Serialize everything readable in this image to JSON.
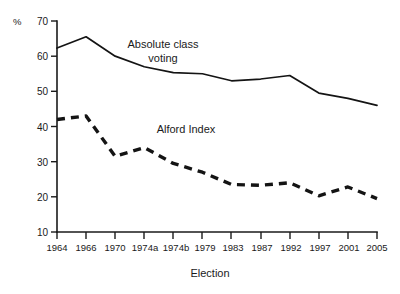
{
  "chart_data": {
    "type": "line",
    "title": "",
    "xlabel": "Election",
    "ylabel": "%",
    "ylim": [
      10,
      70
    ],
    "yticks": [
      10,
      20,
      30,
      40,
      50,
      60,
      70
    ],
    "grid": false,
    "legend_position": "inline-annotations",
    "categories": [
      "1964",
      "1966",
      "1970",
      "1974a",
      "1974b",
      "1979",
      "1983",
      "1987",
      "1992",
      "1997",
      "2001",
      "2005"
    ],
    "series": [
      {
        "name": "Absolute class voting",
        "style": "solid",
        "values": [
          62.3,
          65.5,
          60.0,
          57.0,
          55.3,
          55.0,
          53.0,
          53.5,
          54.5,
          49.5,
          48.0,
          46.0
        ]
      },
      {
        "name": "Alford Index",
        "style": "dashed",
        "values": [
          42.0,
          43.0,
          31.5,
          34.0,
          29.5,
          27.0,
          23.5,
          23.3,
          24.0,
          20.3,
          22.8,
          19.5
        ]
      }
    ],
    "annotations": [
      {
        "id": "absolute-class-voting-label",
        "text": "Absolute class voting",
        "line1": "Absolute class",
        "line2": "voting"
      },
      {
        "id": "alford-index-label",
        "text": "Alford Index",
        "line1": "Alford Index",
        "line2": ""
      }
    ],
    "colors": {
      "axis": "#1a1a1a",
      "series_absolute_class_voting": "#141414",
      "series_alford_index": "#141414",
      "background": "#ffffff"
    }
  },
  "axis": {
    "y_unit": "%",
    "y_tick_labels": [
      "70",
      "60",
      "50",
      "40",
      "30",
      "20",
      "10"
    ],
    "x_tick_labels": [
      "1964",
      "1966",
      "1970",
      "1974a",
      "1974b",
      "1979",
      "1983",
      "1987",
      "1992",
      "1997",
      "2001",
      "2005"
    ],
    "x_title": "Election"
  }
}
